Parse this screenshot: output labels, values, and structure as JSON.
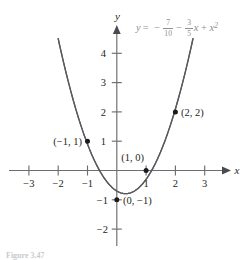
{
  "figure": {
    "caption": "Figure 3.47",
    "equation": {
      "lhs": "y",
      "equals": "=",
      "term1_sign": "−",
      "term1_num": "7",
      "term1_den": "10",
      "term2_sign": "−",
      "term2_num": "3",
      "term2_den": "5",
      "term2_var": "x",
      "term3_sign": "+",
      "term3_var": "x",
      "term3_exp": "2",
      "plain": "y = -7/10 - (3/5)x + x^2"
    },
    "colors": {
      "curve": "#595a5e",
      "axis": "#6e6e72",
      "equation_text": "#8d8f93",
      "point": "#1b1b1d",
      "label_text": "#231f20",
      "background": "#ffffff",
      "caption": "#c9cacd"
    }
  },
  "axes": {
    "x_name": "x",
    "y_name": "y",
    "x_ticks": [
      {
        "value": -3,
        "label": "−3"
      },
      {
        "value": -2,
        "label": "−2"
      },
      {
        "value": -1,
        "label": "−1"
      },
      {
        "value": 1,
        "label": "1"
      },
      {
        "value": 2,
        "label": "2"
      },
      {
        "value": 3,
        "label": "3"
      }
    ],
    "y_ticks": [
      {
        "value": 4,
        "label": "4"
      },
      {
        "value": 3,
        "label": "3"
      },
      {
        "value": 2,
        "label": "2"
      },
      {
        "value": 1,
        "label": "1"
      },
      {
        "value": -1,
        "label": "−1"
      },
      {
        "value": -2,
        "label": "−2"
      }
    ],
    "xlim": [
      -3.7,
      3.9
    ],
    "ylim": [
      -2.6,
      4.7
    ]
  },
  "points": [
    {
      "x": -1,
      "y": 1,
      "label": "(−1, 1)",
      "label_side": "left"
    },
    {
      "x": 1,
      "y": 0,
      "label": "(1, 0)",
      "label_side": "above-left"
    },
    {
      "x": 2,
      "y": 2,
      "label": "(2, 2)",
      "label_side": "right"
    },
    {
      "x": 0,
      "y": -1,
      "label": "(0, −1)",
      "label_side": "right"
    }
  ],
  "chart_data": {
    "type": "line",
    "title": "",
    "xlabel": "x",
    "ylabel": "y",
    "grid": false,
    "legend": "none",
    "xlim": [
      -3.7,
      3.9
    ],
    "ylim": [
      -2.6,
      4.7
    ],
    "annotations": [
      "y = -7/10 - (3/5)x + x^2",
      "(-1, 1)",
      "(1, 0)",
      "(2, 2)",
      "(0, -1)"
    ],
    "series": [
      {
        "name": "y = -7/10 - (3/5)x + x^2",
        "equation": "y = -0.7 - 0.6*x + x^2",
        "vertex": [
          0.3,
          -0.79
        ],
        "roots": [
          -0.6246,
          1.2246
        ],
        "y_intercept": -0.7,
        "x_domain": [
          -2.0,
          2.6
        ],
        "x": [
          -2.0,
          -1.8,
          -1.6,
          -1.4,
          -1.2,
          -1.0,
          -0.8,
          -0.6,
          -0.4,
          -0.2,
          0.0,
          0.2,
          0.4,
          0.6,
          0.8,
          1.0,
          1.2,
          1.4,
          1.6,
          1.8,
          2.0,
          2.2,
          2.4,
          2.6
        ],
        "y": [
          4.5,
          3.62,
          2.82,
          2.1,
          1.46,
          0.9,
          0.42,
          0.02,
          -0.3,
          -0.54,
          -0.7,
          -0.78,
          -0.78,
          -0.7,
          -0.54,
          -0.3,
          0.02,
          0.42,
          0.9,
          1.46,
          2.1,
          2.82,
          3.62,
          4.5
        ]
      }
    ],
    "marked_points": [
      {
        "x": -1,
        "y": 1,
        "label": "(-1, 1)"
      },
      {
        "x": 1,
        "y": 0,
        "label": "(1, 0)"
      },
      {
        "x": 2,
        "y": 2,
        "label": "(2, 2)"
      },
      {
        "x": 0,
        "y": -1,
        "label": "(0, -1)"
      }
    ]
  }
}
